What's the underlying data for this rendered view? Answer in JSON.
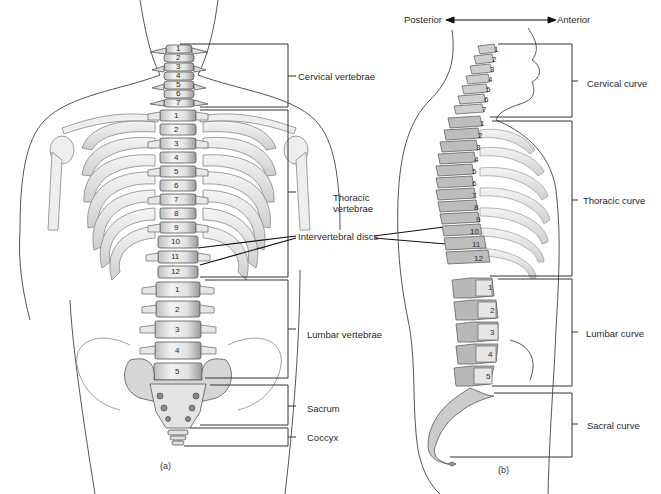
{
  "figure": {
    "orientation": {
      "left_label": "Posterior",
      "right_label": "Anterior"
    },
    "panel_a": {
      "caption": "(a)",
      "view": "anterior",
      "labels": {
        "cervical": "Cervical vertebrae",
        "thoracic_line1": "Thoracic",
        "thoracic_line2": "vertebrae",
        "intervertebral": "Intervertebral discs",
        "lumbar": "Lumbar vertebrae",
        "sacrum": "Sacrum",
        "coccyx": "Coccyx"
      },
      "vertebra_numbers": {
        "cervical": [
          "1",
          "2",
          "3",
          "4",
          "5",
          "6",
          "7"
        ],
        "thoracic": [
          "1",
          "2",
          "3",
          "4",
          "5",
          "6",
          "7",
          "8",
          "9",
          "10",
          "11",
          "12"
        ],
        "lumbar": [
          "1",
          "2",
          "3",
          "4",
          "5"
        ]
      }
    },
    "panel_b": {
      "caption": "(b)",
      "view": "lateral",
      "labels": {
        "cervical": "Cervical curve",
        "thoracic": "Thoracic curve",
        "lumbar": "Lumbar curve",
        "sacral": "Sacral curve"
      },
      "vertebra_numbers": {
        "cervical": [
          "1",
          "2",
          "3",
          "4",
          "5",
          "6",
          "7"
        ],
        "thoracic": [
          "1",
          "2",
          "3",
          "4",
          "5",
          "6",
          "7",
          "8",
          "9",
          "10",
          "11",
          "12"
        ],
        "lumbar": [
          "1",
          "2",
          "3",
          "4",
          "5"
        ]
      }
    }
  }
}
